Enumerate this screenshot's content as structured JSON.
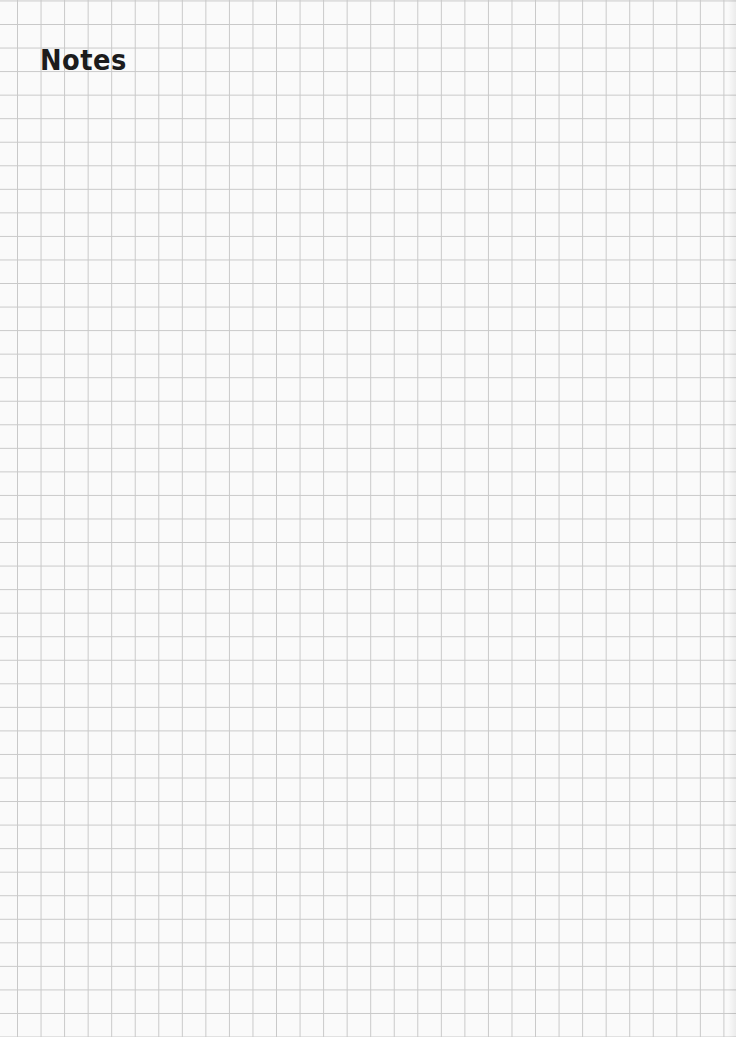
{
  "page": {
    "title": "Notes",
    "style": "grid-paper",
    "grid_color": "#c9c9c9",
    "background_color": "#fafafa",
    "text_color": "#1c1c1c"
  }
}
